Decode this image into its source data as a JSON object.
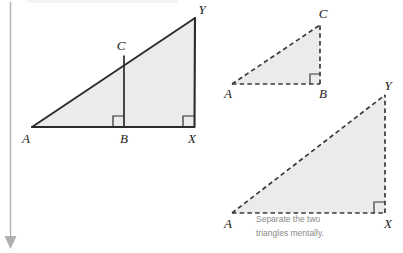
{
  "figure": {
    "background_color": "#ffffff",
    "fill_color": "#ebebeb",
    "solid_stroke_color": "#2b2b2b",
    "dashed_stroke_color": "#3a3a3a",
    "rule_color": "#b0b0b0",
    "caption_color": "#8a8a8a"
  },
  "caption": {
    "line1": "Separate the two",
    "line2": "triangles mentally."
  },
  "combined_figure": {
    "name": "overlapping-triangles",
    "style": "solid",
    "labels": {
      "a": "A",
      "b": "B",
      "c": "C",
      "x": "X",
      "y": "Y"
    },
    "points": {
      "a": [
        32,
        127
      ],
      "b": [
        124,
        127
      ],
      "c": [
        124,
        56
      ],
      "x": [
        194,
        127
      ],
      "y": [
        195,
        18
      ]
    },
    "right_angles": [
      "B",
      "X"
    ]
  },
  "small_triangle": {
    "name": "triangle-abc",
    "style": "dashed",
    "labels": {
      "a": "A",
      "b": "B",
      "c": "C"
    },
    "points": {
      "a": [
        232,
        84
      ],
      "b": [
        320,
        84
      ],
      "c": [
        320,
        25
      ]
    },
    "right_angles": [
      "B"
    ]
  },
  "large_triangle": {
    "name": "triangle-axy",
    "style": "dashed",
    "labels": {
      "a": "A",
      "x": "X",
      "y": "Y"
    },
    "points": {
      "a": [
        232,
        213
      ],
      "x": [
        385,
        213
      ],
      "y": [
        385,
        95
      ]
    },
    "right_angles": [
      "X"
    ]
  },
  "margin_rule": {
    "name": "left-margin-rule",
    "arrow_direction": "down"
  }
}
